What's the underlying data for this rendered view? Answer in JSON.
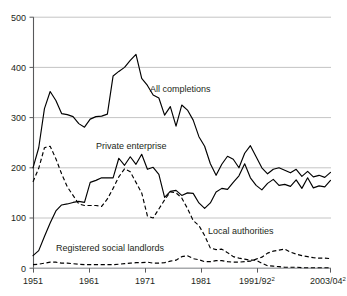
{
  "chart_data": {
    "type": "line",
    "title": "",
    "subtitle": "",
    "xlabel": "",
    "ylabel": "",
    "ylim": [
      0,
      500
    ],
    "yticks": [
      0,
      100,
      200,
      300,
      400,
      500
    ],
    "ytick_labels": [
      "0",
      "100",
      "200",
      "300",
      "400",
      "500"
    ],
    "grid": true,
    "legend_position": "inline-annotations",
    "x": [
      "1951",
      "1952",
      "1953",
      "1954",
      "1955",
      "1956",
      "1957",
      "1958",
      "1959",
      "1960",
      "1961",
      "1962",
      "1963",
      "1964",
      "1965",
      "1966",
      "1967",
      "1968",
      "1969",
      "1970",
      "1971",
      "1972",
      "1973",
      "1974",
      "1975",
      "1976",
      "1977",
      "1978",
      "1979",
      "1980",
      "1981",
      "1982",
      "1983",
      "1984",
      "1985",
      "1986",
      "1987",
      "1988",
      "1989",
      "1990",
      "1991/92",
      "1992/93",
      "1993/94",
      "1994/95",
      "1995/96",
      "1996/97",
      "1997/98",
      "1998/99",
      "1999/00",
      "2000/01",
      "2001/02",
      "2002/03",
      "2003/04"
    ],
    "xticks": [
      "1951",
      "1961",
      "1971",
      "1981",
      "1991/92",
      "2003/04"
    ],
    "xtick_labels": [
      "1951",
      "1961",
      "1971",
      "1981",
      "1991/92²",
      "2003/04²"
    ],
    "xtick_superscripts": [
      "",
      "",
      "",
      "",
      "2",
      "2"
    ],
    "series": [
      {
        "name": "All completions",
        "style": "solid",
        "color": "#000000",
        "label_x": "1972",
        "label_y": 350,
        "values": [
          200,
          240,
          318,
          352,
          334,
          308,
          306,
          302,
          288,
          281,
          297,
          302,
          303,
          307,
          383,
          392,
          400,
          414,
          426,
          378,
          364,
          345,
          339,
          305,
          322,
          283,
          325,
          315,
          295,
          262,
          243,
          208,
          185,
          207,
          223,
          217,
          200,
          229,
          244,
          222,
          200,
          188,
          197,
          200,
          195,
          190,
          197,
          183,
          193,
          182,
          185,
          181,
          191
        ]
      },
      {
        "name": "Private enterprise",
        "style": "solid",
        "color": "#000000",
        "label_x": "1964",
        "label_y": 243,
        "values": [
          25,
          35,
          63,
          90,
          114,
          126,
          128,
          131,
          133,
          131,
          171,
          175,
          180,
          180,
          180,
          219,
          205,
          222,
          207,
          227,
          197,
          201,
          187,
          141,
          153,
          155,
          145,
          150,
          149,
          130,
          119,
          130,
          152,
          159,
          157,
          171,
          184,
          208,
          180,
          165,
          156,
          169,
          177,
          165,
          167,
          163,
          176,
          159,
          180,
          160,
          164,
          162,
          175
        ]
      },
      {
        "name": "Local authorities",
        "style": "dashed",
        "color": "#000000",
        "label_x": "1982",
        "label_y": 75,
        "values": [
          172,
          199,
          240,
          243,
          218,
          188,
          162,
          145,
          128,
          125,
          125,
          125,
          123,
          138,
          159,
          182,
          198,
          192,
          171,
          150,
          104,
          100,
          118,
          136,
          152,
          150,
          140,
          119,
          95,
          85,
          65,
          40,
          37,
          38,
          31,
          23,
          20,
          18,
          16,
          16,
          10,
          5,
          4,
          3,
          2,
          2,
          2,
          1,
          1,
          1,
          1,
          1,
          1
        ]
      },
      {
        "name": "Registered social landlords",
        "style": "dashed",
        "color": "#000000",
        "label_x": "1959",
        "label_y": 40,
        "values": [
          7,
          8,
          10,
          12,
          12,
          10,
          10,
          9,
          8,
          7,
          7,
          7,
          7,
          7,
          7,
          8,
          9,
          10,
          11,
          11,
          12,
          10,
          10,
          11,
          14,
          16,
          23,
          25,
          19,
          17,
          13,
          13,
          15,
          15,
          13,
          12,
          12,
          13,
          14,
          18,
          22,
          30,
          34,
          36,
          38,
          32,
          28,
          25,
          23,
          21,
          20,
          20,
          19
        ]
      }
    ]
  },
  "annotations": {
    "all_completions": "All completions",
    "private_enterprise": "Private enterprise",
    "local_authorities": "Local authorities",
    "registered_social_landlords": "Registered social landlords"
  },
  "axis": {
    "y_0": "0",
    "y_100": "100",
    "y_200": "200",
    "y_300": "300",
    "y_400": "400",
    "y_500": "500",
    "x_1951": "1951",
    "x_1961": "1961",
    "x_1971": "1971",
    "x_1981": "1981",
    "x_1991": "1991/92",
    "x_1991_sup": "2",
    "x_2003": "2003/04",
    "x_2003_sup": "2"
  }
}
